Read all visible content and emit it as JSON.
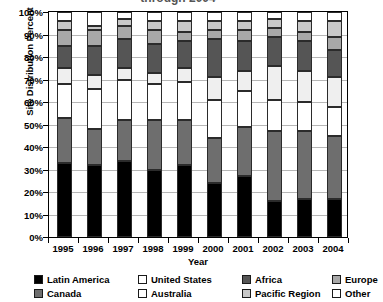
{
  "chart_data": {
    "type": "bar",
    "subtype": "stacked-percent-column",
    "title": "through 2004",
    "xlabel": "Year",
    "ylabel": "Site Distribution Percent",
    "categories": [
      "1995",
      "1996",
      "1997",
      "1998",
      "1999",
      "2000",
      "2001",
      "2002",
      "2003",
      "2004"
    ],
    "ylim": [
      0,
      100
    ],
    "ytick_labels": [
      "0%",
      "10%",
      "20%",
      "30%",
      "40%",
      "50%",
      "60%",
      "70%",
      "80%",
      "90%",
      "100%"
    ],
    "ytick_values": [
      0,
      10,
      20,
      30,
      40,
      50,
      60,
      70,
      80,
      90,
      100
    ],
    "grid": true,
    "legend_position": "bottom",
    "series": [
      {
        "name": "Latin America",
        "color": "#000000",
        "values": [
          33,
          32,
          34,
          30,
          32,
          24,
          27,
          16,
          17,
          17
        ]
      },
      {
        "name": "Canada",
        "color": "#6e6e6e",
        "values": [
          20,
          16,
          18,
          22,
          20,
          20,
          22,
          31,
          30,
          28
        ]
      },
      {
        "name": "United States",
        "color": "#ffffff",
        "values": [
          15,
          18,
          18,
          16,
          17,
          17,
          16,
          14,
          13,
          13
        ]
      },
      {
        "name": "Australia",
        "color": "#efefef",
        "values": [
          7,
          6,
          5,
          5,
          6,
          10,
          9,
          15,
          14,
          13
        ]
      },
      {
        "name": "Africa",
        "color": "#555555",
        "values": [
          10,
          13,
          13,
          13,
          12,
          17,
          13,
          13,
          13,
          12
        ]
      },
      {
        "name": "Europe",
        "color": "#a8a8a8",
        "values": [
          7,
          7,
          6,
          6,
          4,
          4,
          5,
          4,
          4,
          6
        ]
      },
      {
        "name": "Pacific Region",
        "color": "#c8c8c8",
        "values": [
          4,
          2,
          3,
          4,
          5,
          4,
          4,
          4,
          5,
          7
        ]
      },
      {
        "name": "Other",
        "color": "#ffffff",
        "values": [
          4,
          6,
          3,
          4,
          4,
          4,
          4,
          3,
          4,
          4
        ]
      }
    ]
  },
  "legend": {
    "items": [
      {
        "label": "Latin America",
        "color": "#000000"
      },
      {
        "label": "United States",
        "color": "#ffffff"
      },
      {
        "label": "Africa",
        "color": "#555555"
      },
      {
        "label": "Europe",
        "color": "#a8a8a8"
      },
      {
        "label": "Canada",
        "color": "#6e6e6e"
      },
      {
        "label": "Australia",
        "color": "#ffffff"
      },
      {
        "label": "Pacific Region",
        "color": "#c8c8c8"
      },
      {
        "label": "Other",
        "color": "#ffffff"
      }
    ]
  }
}
